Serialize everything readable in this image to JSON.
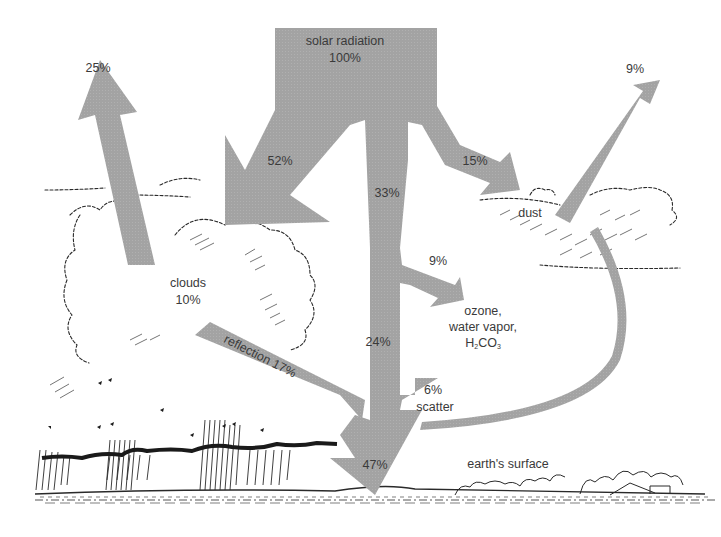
{
  "diagram": {
    "arrow_color": "#a3a3a3",
    "sketch_color": "#2a2a2a",
    "labels": {
      "solar_title": "solar radiation",
      "solar_value": "100%",
      "to_space_clouds": "25%",
      "to_space_dust": "9%",
      "clouds_reflect_down": "52%",
      "direct_beam": "33%",
      "to_dust": "15%",
      "dust": "dust",
      "to_ozone": "9%",
      "ozone_line1": "ozone,",
      "ozone_line2": "water vapor,",
      "ozone_line3_pre": "H",
      "ozone_line3_sub1": "2",
      "ozone_line3_mid": "CO",
      "ozone_line3_sub2": "3",
      "clouds_title": "clouds",
      "clouds_value": "10%",
      "reflection": "reflection 17%",
      "direct_surface": "24%",
      "scatter_value": "6%",
      "scatter_label": "scatter",
      "surface_total": "47%",
      "surface": "earth's surface"
    },
    "flows": [
      {
        "from": "solar radiation",
        "to": "clouds",
        "percent": 52
      },
      {
        "from": "solar radiation",
        "to": "direct",
        "percent": 33
      },
      {
        "from": "solar radiation",
        "to": "dust",
        "percent": 15
      },
      {
        "from": "clouds",
        "to": "space",
        "percent": 25
      },
      {
        "from": "clouds",
        "to": "absorbed",
        "percent": 10
      },
      {
        "from": "clouds",
        "to": "earth's surface (reflection)",
        "percent": 17
      },
      {
        "from": "direct",
        "to": "ozone, water vapor, H2CO3",
        "percent": 9
      },
      {
        "from": "direct",
        "to": "earth's surface",
        "percent": 24
      },
      {
        "from": "dust",
        "to": "space",
        "percent": 9
      },
      {
        "from": "dust",
        "to": "earth's surface (scatter)",
        "percent": 6
      },
      {
        "from": "all",
        "to": "earth's surface",
        "percent": 47
      }
    ]
  }
}
